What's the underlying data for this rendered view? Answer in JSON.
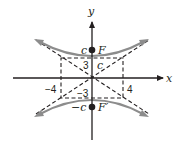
{
  "figure": {
    "axes": {
      "x_label": "x",
      "y_label": "y"
    },
    "tick_labels": {
      "left": "−4",
      "right": "4",
      "top": "3",
      "bottom": "−3"
    },
    "foci": {
      "upper": {
        "label": "F",
        "coord_label": "c"
      },
      "lower": {
        "label": "F′",
        "coord_label": "−c"
      }
    },
    "diagonal_label": "c",
    "colors": {
      "axes": "#231f20",
      "hyperbola": "#8c8c8c",
      "dashed": "#231f20",
      "focus_point": "#231f20"
    }
  }
}
